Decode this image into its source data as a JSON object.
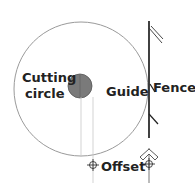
{
  "diagram": {
    "labels": {
      "cutting_line1": "Cutting",
      "cutting_line2": "circle",
      "guide": "Guide",
      "fence": "Fence",
      "offset": "Offset"
    },
    "colors": {
      "guide_circle": "#9a9a9a",
      "cutting_circle_fill": "#7a7a7a",
      "fence": "#111111",
      "text": "#222222"
    }
  }
}
